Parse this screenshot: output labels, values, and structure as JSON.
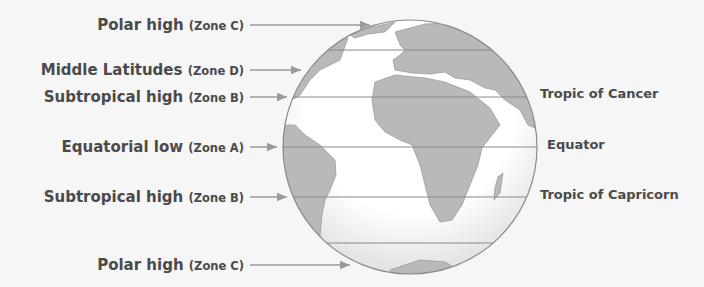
{
  "diagram": {
    "left_labels": [
      {
        "main": "Polar high",
        "zone": "(Zone C)",
        "y": 25,
        "arrow_end": 370
      },
      {
        "main": "Middle Latitudes",
        "zone": "(Zone D)",
        "y": 70,
        "arrow_end": 301
      },
      {
        "main": "Subtropical high",
        "zone": "(Zone B)",
        "y": 97,
        "arrow_end": 287
      },
      {
        "main": "Equatorial low",
        "zone": "(Zone A)",
        "y": 147,
        "arrow_end": 277
      },
      {
        "main": "Subtropical high",
        "zone": "(Zone B)",
        "y": 197,
        "arrow_end": 287
      },
      {
        "main": "Polar high",
        "zone": "(Zone C)",
        "y": 265,
        "arrow_end": 350
      }
    ],
    "right_labels": [
      {
        "text": "Tropic of Cancer",
        "y": 97
      },
      {
        "text": "Equator",
        "y": 147
      },
      {
        "text": "Tropic of Capricorn",
        "y": 197
      }
    ],
    "colors": {
      "background": "#f6f6f6",
      "land": "#b9b9b9",
      "ocean": "#ffffff",
      "line": "#8a8a8a",
      "arrow": "#9a9a9a",
      "text": "#4a4a4a"
    }
  }
}
